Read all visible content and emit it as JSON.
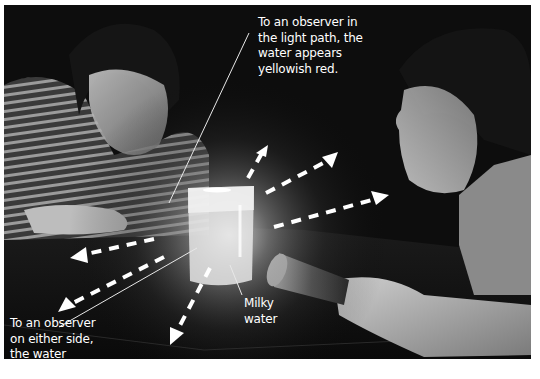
{
  "figure": {
    "labels": {
      "top": "To an observer in\nthe light path, the\nwater appears\nyellowish red.",
      "left": "To an observer\non either side,\nthe water\nappears bluish.",
      "milky": "Milky\nwater"
    },
    "colors": {
      "background": "#0b0b0b",
      "text": "#ffffff",
      "arrows": "#ffffff",
      "border": "#ffffff"
    },
    "scene_elements": [
      "observer-left-striped-sweater",
      "observer-right-holding-flashlight",
      "beaker-of-milky-water",
      "flashlight",
      "scattered-light-arrows",
      "leader-lines"
    ]
  }
}
